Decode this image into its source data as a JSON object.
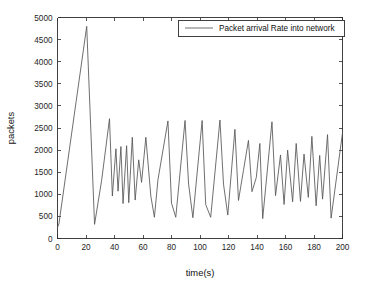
{
  "chart_data": {
    "type": "line",
    "title": "",
    "subtitle": "",
    "xlabel": "time(s)",
    "ylabel": "packets",
    "xlim": [
      0,
      200
    ],
    "ylim": [
      0,
      5000
    ],
    "xticks": [
      0,
      20,
      40,
      60,
      80,
      100,
      120,
      140,
      160,
      180,
      200
    ],
    "yticks": [
      0,
      500,
      1000,
      1500,
      2000,
      2500,
      3000,
      3500,
      4000,
      4500,
      5000
    ],
    "xtick_labels": [
      "0",
      "20",
      "40",
      "60",
      "80",
      "100",
      "120",
      "140",
      "160",
      "180",
      "200"
    ],
    "ytick_labels": [
      "0",
      "500",
      "1000",
      "1500",
      "2000",
      "2500",
      "3000",
      "3500",
      "4000",
      "4500",
      "5000"
    ],
    "grid": false,
    "legend_position": "top-right",
    "legend": [
      "Packet arrival Rate into network"
    ],
    "line_color": "#555555",
    "axis_color": "#2b2b2b",
    "background_color": "#ffffff",
    "series": [
      {
        "name": "Packet arrival Rate into network",
        "x": [
          0,
          1,
          20.5,
          26,
          31,
          36.5,
          38.5,
          41,
          42.5,
          44.5,
          46,
          48.5,
          50,
          52.5,
          54.5,
          57,
          59,
          62,
          65.5,
          68,
          70.5,
          77.5,
          80,
          83,
          89.5,
          92,
          95,
          101.5,
          104,
          107.5,
          114,
          116.5,
          119.5,
          124.5,
          127,
          130.5,
          134,
          136.5,
          139.5,
          142,
          144,
          150.5,
          153,
          156.5,
          159,
          161.5,
          165,
          167.5,
          170.5,
          173,
          176,
          178.5,
          181.5,
          184,
          186,
          189.5,
          192,
          200
        ],
        "y": [
          250,
          330,
          4800,
          320,
          1320,
          2710,
          960,
          2030,
          1070,
          2080,
          790,
          2100,
          810,
          2290,
          870,
          1780,
          1270,
          2290,
          960,
          480,
          1330,
          2660,
          800,
          480,
          2670,
          1230,
          470,
          2670,
          770,
          480,
          2680,
          1230,
          530,
          2470,
          860,
          1540,
          2220,
          1060,
          1380,
          2150,
          450,
          2640,
          970,
          1890,
          770,
          2000,
          830,
          2150,
          840,
          1910,
          930,
          2310,
          740,
          1880,
          890,
          2350,
          460,
          2390
        ]
      }
    ]
  },
  "axes": {
    "xlabel": "time(s)",
    "ylabel": "packets"
  },
  "legend": {
    "entries": [
      {
        "label": "Packet arrival Rate into network"
      }
    ]
  }
}
